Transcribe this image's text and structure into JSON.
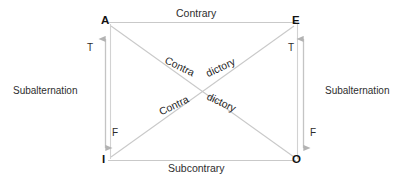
{
  "diagram": {
    "background_color": "#ffffff",
    "line_color": "#c9c9c9",
    "arrow_color": "#b0b0b0",
    "text_color": "#2b2b2b",
    "vertices": {
      "top_left": "A",
      "top_right": "E",
      "bottom_left": "I",
      "bottom_right": "O"
    },
    "edges": {
      "top": "Contrary",
      "bottom": "Subcontrary",
      "left": "Subalternation",
      "right": "Subalternation"
    },
    "diagonals": {
      "upper_left_word": "Contra",
      "upper_right_word": "dictory",
      "lower_left_word": "Contra",
      "lower_right_word": "dictory"
    },
    "truth_markers": {
      "left_top": "T",
      "left_bottom": "F",
      "right_top": "T",
      "right_bottom": "F"
    }
  }
}
